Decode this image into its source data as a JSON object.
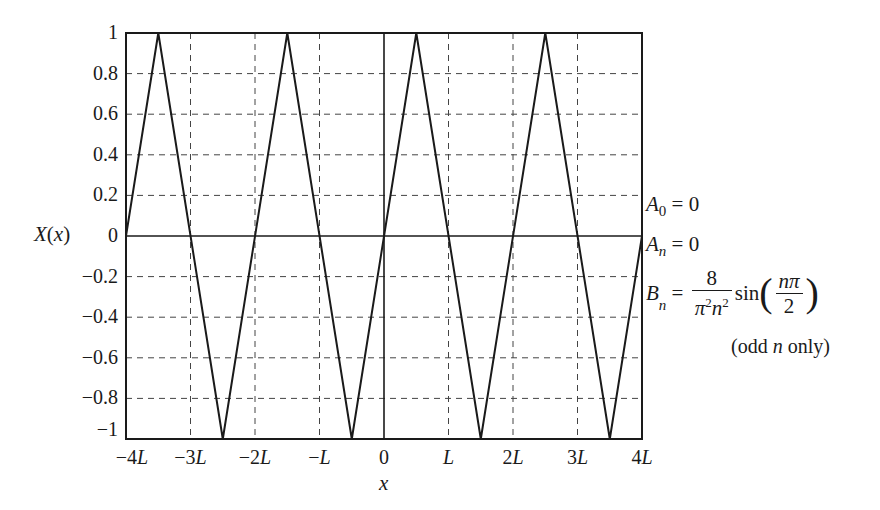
{
  "chart_data": {
    "type": "line",
    "title": "",
    "xlabel": "x",
    "ylabel": "X(x)",
    "xlim": [
      -4,
      4
    ],
    "ylim": [
      -1,
      1
    ],
    "x_unit": "L",
    "grid": true,
    "grid_style": "dashed",
    "x_ticks": [
      "-4L",
      "-3L",
      "-2L",
      "-L",
      "0",
      "L",
      "2L",
      "3L",
      "4L"
    ],
    "x_tick_values": [
      -4,
      -3,
      -2,
      -1,
      0,
      1,
      2,
      3,
      4
    ],
    "y_ticks": [
      "1",
      "0.8",
      "0.6",
      "0.4",
      "0.2",
      "0",
      "-0.2",
      "-0.4",
      "-0.6",
      "-0.8",
      "-1"
    ],
    "y_tick_values": [
      1,
      0.8,
      0.6,
      0.4,
      0.2,
      0,
      -0.2,
      -0.4,
      -0.6,
      -0.8,
      -1
    ],
    "series": [
      {
        "name": "X(x) triangle wave",
        "x": [
          -4,
          -3.5,
          -2.5,
          -1.5,
          -0.5,
          0.5,
          1.5,
          2.5,
          3.5,
          4
        ],
        "y": [
          0,
          1,
          -1,
          1,
          -1,
          1,
          -1,
          1,
          -1,
          0
        ]
      }
    ],
    "annotations": [
      "A_0 = 0",
      "A_n = 0",
      "B_n = 8/(π²n²) sin(nπ/2)",
      "(odd n only)"
    ]
  },
  "labels": {
    "ylabel_main": "X",
    "ylabel_arg": "(x)",
    "xlabel": "x",
    "y_ticks": [
      "1",
      "0.8",
      "0.6",
      "0.4",
      "0.2",
      "0",
      "−0.2",
      "−0.4",
      "−0.6",
      "−0.8",
      "−1"
    ],
    "x_ticks": [
      "−4L",
      "−3L",
      "−2L",
      "−L",
      "0",
      "L",
      "2L",
      "3L",
      "4L"
    ]
  },
  "annotations": {
    "a0": {
      "sym": "A",
      "sub": "0",
      "rhs": " = 0"
    },
    "an": {
      "sym": "A",
      "sub": "n",
      "rhs": " = 0"
    },
    "bn": {
      "sym": "B",
      "sub": "n",
      "eq": " = ",
      "num": "8",
      "den_pi": "π",
      "den_pow1": "2",
      "den_n": "n",
      "den_pow2": "2",
      "fn": "sin",
      "inner_num": "nπ",
      "inner_den": "2"
    },
    "note_open": "(odd ",
    "note_n": "n",
    "note_close": " only)"
  }
}
